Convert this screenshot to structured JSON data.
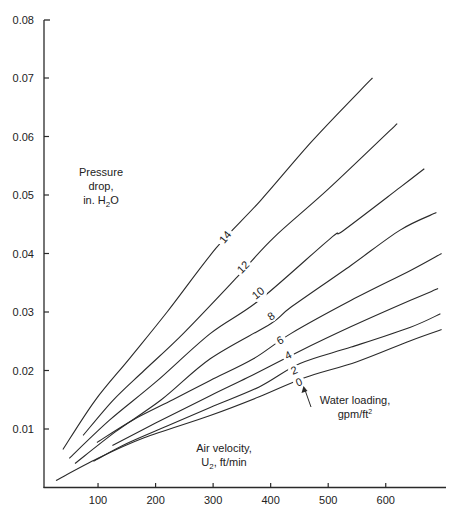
{
  "chart_data": {
    "type": "line",
    "title": "",
    "xlabel": "Air velocity, U2, ft/min",
    "ylabel": "Pressure drop, in. H2O",
    "xlim": [
      0,
      700
    ],
    "ylim": [
      0,
      0.08
    ],
    "x_ticks": [
      100,
      200,
      300,
      400,
      500,
      600
    ],
    "x_tick_labels": [
      "100",
      "200",
      "300",
      "400",
      "500",
      "600"
    ],
    "y_ticks": [
      0.01,
      0.02,
      0.03,
      0.04,
      0.05,
      0.06,
      0.07,
      0.08
    ],
    "y_tick_labels": [
      "0.01",
      "0.02",
      "0.03",
      "0.04",
      "0.05",
      "0.06",
      "0.07",
      "0.08"
    ],
    "grid": false,
    "legend": "curves labeled inline by water loading",
    "series_parameter": "Water loading, gpm/ft²",
    "series": [
      {
        "name": "14",
        "x": [
          39,
          95,
          156,
          220,
          305,
          382,
          470,
          556,
          577
        ],
        "y": [
          0.0065,
          0.0149,
          0.0222,
          0.03,
          0.0409,
          0.049,
          0.059,
          0.0679,
          0.07
        ]
      },
      {
        "name": "12",
        "x": [
          74,
          126,
          180,
          248,
          342,
          404,
          500,
          620
        ],
        "y": [
          0.0089,
          0.0149,
          0.02,
          0.0263,
          0.036,
          0.0426,
          0.051,
          0.0622
        ]
      },
      {
        "name": "10",
        "x": [
          50,
          120,
          200,
          295,
          380,
          504,
          526,
          625,
          667
        ],
        "y": [
          0.005,
          0.0115,
          0.018,
          0.0263,
          0.032,
          0.0426,
          0.0439,
          0.0513,
          0.0545
        ]
      },
      {
        "name": "8",
        "x": [
          60,
          130,
          210,
          295,
          400,
          435,
          540,
          625,
          688
        ],
        "y": [
          0.0041,
          0.0095,
          0.015,
          0.022,
          0.028,
          0.0308,
          0.038,
          0.044,
          0.047
        ]
      },
      {
        "name": "6",
        "x": [
          98,
          160,
          230,
          295,
          370,
          435,
          540,
          643,
          697
        ],
        "y": [
          0.0077,
          0.0115,
          0.015,
          0.0183,
          0.022,
          0.0263,
          0.032,
          0.0371,
          0.04
        ]
      },
      {
        "name": "4",
        "x": [
          125,
          200,
          295,
          360,
          446,
          540,
          643,
          691
        ],
        "y": [
          0.0072,
          0.011,
          0.0157,
          0.0188,
          0.0231,
          0.0275,
          0.032,
          0.034
        ]
      },
      {
        "name": "2",
        "x": [
          92,
          150,
          220,
          295,
          380,
          451,
          540,
          643,
          695
        ],
        "y": [
          0.0045,
          0.0075,
          0.0105,
          0.0137,
          0.0172,
          0.0212,
          0.024,
          0.0274,
          0.0297
        ]
      },
      {
        "name": "0",
        "x": [
          27,
          100,
          180,
          295,
          380,
          460,
          550,
          643,
          697
        ],
        "y": [
          0.0012,
          0.005,
          0.0085,
          0.0123,
          0.0155,
          0.0188,
          0.0215,
          0.0251,
          0.027
        ]
      }
    ],
    "annotations": [
      {
        "text": "Pressure drop, in. H2O"
      },
      {
        "text": "Air velocity, U2, ft/min"
      },
      {
        "text": "Water loading, gpm/ft²",
        "arrow_to_curve": "0"
      }
    ]
  },
  "labels": {
    "ylabel_lines": [
      "Pressure",
      "drop,",
      "in. H",
      "2",
      "O"
    ],
    "xlabel_lines": [
      "Air velocity,",
      "U",
      "2",
      ", ft/min"
    ],
    "water_lines": [
      "Water loading,",
      "gpm/ft",
      "2"
    ]
  },
  "curve_label_positions": {
    "14": [
      225,
      237
    ],
    "12": [
      243,
      267
    ],
    "10": [
      258,
      293
    ],
    "8": [
      271,
      316
    ],
    "6": [
      280,
      340
    ],
    "4": [
      288,
      355
    ],
    "2": [
      294,
      370
    ],
    "0": [
      299,
      382
    ]
  },
  "colors": {
    "line": "#2a2a2a",
    "text": "#222222",
    "background": "#ffffff"
  }
}
